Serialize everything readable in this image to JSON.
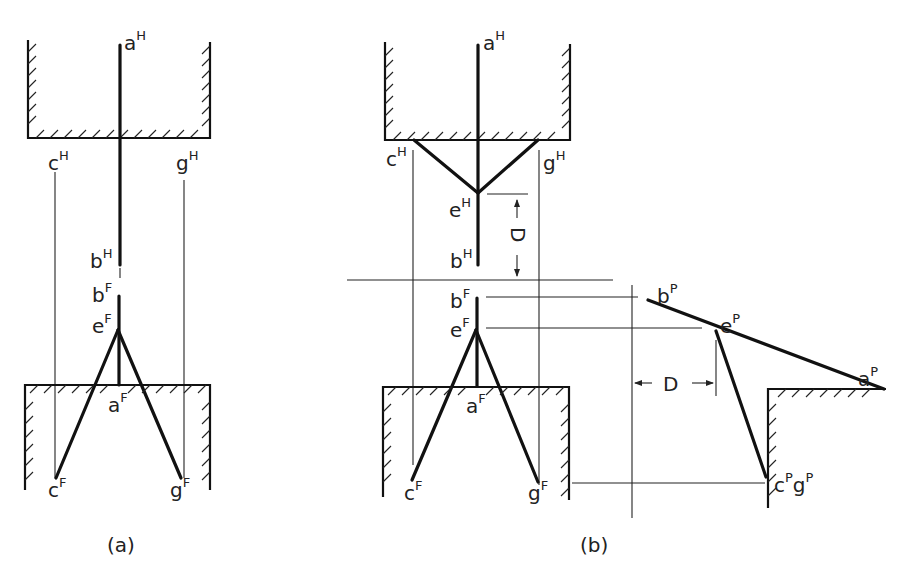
{
  "figure": {
    "panels": [
      {
        "id": "a",
        "caption": "(a)",
        "labels": {
          "aH": {
            "base": "a",
            "sup": "H"
          },
          "cH": {
            "base": "c",
            "sup": "H"
          },
          "gH": {
            "base": "g",
            "sup": "H"
          },
          "bH": {
            "base": "b",
            "sup": "H"
          },
          "bF": {
            "base": "b",
            "sup": "F"
          },
          "eF": {
            "base": "e",
            "sup": "F"
          },
          "aF": {
            "base": "a",
            "sup": "F"
          },
          "cF": {
            "base": "c",
            "sup": "F"
          },
          "gF": {
            "base": "g",
            "sup": "F"
          }
        }
      },
      {
        "id": "b",
        "caption": "(b)",
        "labels": {
          "aH": {
            "base": "a",
            "sup": "H"
          },
          "cH": {
            "base": "c",
            "sup": "H"
          },
          "gH": {
            "base": "g",
            "sup": "H"
          },
          "eH": {
            "base": "e",
            "sup": "H"
          },
          "bH": {
            "base": "b",
            "sup": "H"
          },
          "bF": {
            "base": "b",
            "sup": "F"
          },
          "eF": {
            "base": "e",
            "sup": "F"
          },
          "aF": {
            "base": "a",
            "sup": "F"
          },
          "cF": {
            "base": "c",
            "sup": "F"
          },
          "gF": {
            "base": "g",
            "sup": "F"
          },
          "bP": {
            "base": "b",
            "sup": "P"
          },
          "eP": {
            "base": "e",
            "sup": "P"
          },
          "aP": {
            "base": "a",
            "sup": "P"
          },
          "cPgP": {
            "base1": "c",
            "sup1": "P",
            "base2": "g",
            "sup2": "P"
          }
        },
        "dimensions": {
          "vertical_D": "D",
          "horizontal_D": "D"
        }
      }
    ]
  }
}
